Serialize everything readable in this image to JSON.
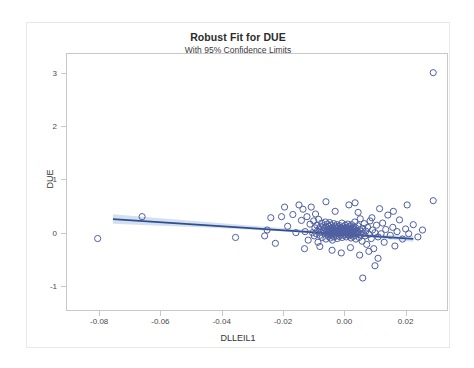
{
  "chart_data": {
    "type": "scatter",
    "title": "Robust Fit for DUE",
    "subtitle": "With 95% Confidence Limits",
    "xlabel": "DLLEIL1",
    "ylabel": "DUE",
    "xlim": [
      -0.0905,
      0.0335
    ],
    "ylim": [
      -1.45,
      3.35
    ],
    "xticks": [
      -0.08,
      -0.06,
      -0.04,
      -0.02,
      0.0,
      0.02
    ],
    "xtick_labels": [
      "-0.08",
      "-0.06",
      "-0.04",
      "-0.02",
      "0.00",
      "0.02"
    ],
    "yticks": [
      -1,
      0,
      1,
      2,
      3
    ],
    "ytick_labels": [
      "-1",
      "0",
      "1",
      "2",
      "3"
    ],
    "grid": false,
    "legend": "none",
    "marker": {
      "shape": "open-circle",
      "stroke": "#4f5fa0",
      "fill": "none",
      "radius": 3.1,
      "stroke_width": 1.0
    },
    "fit_line": {
      "name": "Robust fit",
      "color": "#2f4e8f",
      "width": 1.7,
      "x_start": -0.0755,
      "x_end": 0.0225,
      "y_start": 0.255,
      "y_end": -0.115
    },
    "confidence_band": {
      "name": "95% Confidence Limits",
      "level": 95,
      "fill": "#b9cbe6",
      "opacity": 0.62,
      "x": [
        -0.0755,
        -0.06,
        -0.045,
        -0.03,
        -0.015,
        0.0,
        0.01,
        0.0225
      ],
      "upper": [
        0.345,
        0.272,
        0.2,
        0.13,
        0.062,
        0.0,
        -0.03,
        -0.06
      ],
      "lower": [
        0.165,
        0.13,
        0.096,
        0.056,
        0.008,
        -0.052,
        -0.098,
        -0.17
      ]
    },
    "points": [
      [
        -0.0805,
        -0.11
      ],
      [
        -0.066,
        0.3
      ],
      [
        -0.0355,
        -0.09
      ],
      [
        -0.0252,
        0.05
      ],
      [
        -0.0225,
        -0.2
      ],
      [
        -0.0205,
        0.3
      ],
      [
        -0.0185,
        0.12
      ],
      [
        -0.0168,
        0.34
      ],
      [
        -0.0158,
        0.0
      ],
      [
        -0.0148,
        0.52
      ],
      [
        -0.014,
        0.23
      ],
      [
        -0.0135,
        0.44
      ],
      [
        -0.0128,
        0.02
      ],
      [
        -0.0122,
        0.3
      ],
      [
        -0.0118,
        -0.14
      ],
      [
        -0.0112,
        0.16
      ],
      [
        -0.0108,
        0.48
      ],
      [
        -0.0104,
        0.0
      ],
      [
        -0.01,
        0.22
      ],
      [
        -0.0098,
        -0.06
      ],
      [
        -0.0096,
        0.09
      ],
      [
        -0.0094,
        0.35
      ],
      [
        -0.0092,
        -0.02
      ],
      [
        -0.009,
        0.14
      ],
      [
        -0.0088,
        0.03
      ],
      [
        -0.0086,
        -0.18
      ],
      [
        -0.0084,
        0.25
      ],
      [
        -0.0082,
        0.07
      ],
      [
        -0.008,
        -0.05
      ],
      [
        -0.0078,
        0.11
      ],
      [
        -0.0076,
        0.01
      ],
      [
        -0.0074,
        0.18
      ],
      [
        -0.0072,
        -0.09
      ],
      [
        -0.007,
        0.05
      ],
      [
        -0.0068,
        0.13
      ],
      [
        -0.0066,
        -0.01
      ],
      [
        -0.0064,
        0.08
      ],
      [
        -0.0062,
        0.2
      ],
      [
        -0.006,
        -0.12
      ],
      [
        -0.0058,
        0.02
      ],
      [
        -0.0057,
        0.1
      ],
      [
        -0.0056,
        -0.04
      ],
      [
        -0.0055,
        0.16
      ],
      [
        -0.0054,
        0.0
      ],
      [
        -0.0053,
        0.06
      ],
      [
        -0.0052,
        -0.07
      ],
      [
        -0.0051,
        0.12
      ],
      [
        -0.005,
        0.02
      ],
      [
        -0.0049,
        -0.02
      ],
      [
        -0.0048,
        0.19
      ],
      [
        -0.0047,
        0.04
      ],
      [
        -0.0046,
        -0.1
      ],
      [
        -0.0045,
        0.08
      ],
      [
        -0.0044,
        0.0
      ],
      [
        -0.0043,
        0.14
      ],
      [
        -0.0042,
        -0.05
      ],
      [
        -0.0041,
        0.06
      ],
      [
        -0.004,
        0.01
      ],
      [
        -0.0039,
        -0.14
      ],
      [
        -0.0038,
        0.1
      ],
      [
        -0.0037,
        0.03
      ],
      [
        -0.0036,
        -0.01
      ],
      [
        -0.0035,
        0.17
      ],
      [
        -0.0034,
        -0.08
      ],
      [
        -0.0033,
        0.05
      ],
      [
        -0.0032,
        0.0
      ],
      [
        -0.0031,
        0.09
      ],
      [
        -0.003,
        -0.03
      ],
      [
        -0.0029,
        0.12
      ],
      [
        -0.0028,
        0.02
      ],
      [
        -0.0027,
        -0.06
      ],
      [
        -0.0026,
        0.07
      ],
      [
        -0.0025,
        0.0
      ],
      [
        -0.0024,
        0.15
      ],
      [
        -0.0023,
        -0.11
      ],
      [
        -0.0022,
        0.04
      ],
      [
        -0.0021,
        0.08
      ],
      [
        -0.002,
        -0.02
      ],
      [
        -0.0019,
        0.11
      ],
      [
        -0.0018,
        0.01
      ],
      [
        -0.0017,
        -0.07
      ],
      [
        -0.0016,
        0.06
      ],
      [
        -0.0015,
        0.0
      ],
      [
        -0.0014,
        0.13
      ],
      [
        -0.0013,
        -0.04
      ],
      [
        -0.0012,
        0.03
      ],
      [
        -0.0011,
        0.09
      ],
      [
        -0.001,
        -0.01
      ],
      [
        -0.0009,
        0.05
      ],
      [
        -0.0008,
        0.18
      ],
      [
        -0.0007,
        -0.09
      ],
      [
        -0.0006,
        0.02
      ],
      [
        -0.0005,
        0.07
      ],
      [
        -0.0004,
        0.0
      ],
      [
        -0.0003,
        0.11
      ],
      [
        -0.0002,
        -0.05
      ],
      [
        -0.0001,
        0.04
      ],
      [
        0.0,
        0.01
      ],
      [
        0.0001,
        0.08
      ],
      [
        0.0002,
        -0.03
      ],
      [
        0.0003,
        0.14
      ],
      [
        0.0004,
        0.0
      ],
      [
        0.0005,
        0.05
      ],
      [
        0.0006,
        -0.08
      ],
      [
        0.0007,
        0.1
      ],
      [
        0.0008,
        0.02
      ],
      [
        0.0009,
        -0.01
      ],
      [
        0.001,
        0.06
      ],
      [
        0.0011,
        0.16
      ],
      [
        0.0012,
        -0.04
      ],
      [
        0.0013,
        0.03
      ],
      [
        0.0014,
        0.09
      ],
      [
        0.0015,
        0.0
      ],
      [
        0.0016,
        -0.06
      ],
      [
        0.0017,
        0.12
      ],
      [
        0.0018,
        0.04
      ],
      [
        0.0019,
        -0.02
      ],
      [
        0.002,
        0.07
      ],
      [
        0.0021,
        0.01
      ],
      [
        0.0022,
        -0.1
      ],
      [
        0.0023,
        0.05
      ],
      [
        0.0024,
        0.15
      ],
      [
        0.0025,
        -0.03
      ],
      [
        0.0026,
        0.02
      ],
      [
        0.0027,
        0.08
      ],
      [
        0.0028,
        0.0
      ],
      [
        0.0029,
        -0.07
      ],
      [
        0.003,
        0.11
      ],
      [
        0.0031,
        0.03
      ],
      [
        0.0032,
        -0.01
      ],
      [
        0.0033,
        0.06
      ],
      [
        0.0034,
        0.2
      ],
      [
        0.0035,
        -0.05
      ],
      [
        0.0036,
        0.01
      ],
      [
        0.0037,
        0.09
      ],
      [
        0.0038,
        -0.12
      ],
      [
        0.004,
        0.04
      ],
      [
        0.0042,
        -0.02
      ],
      [
        0.0044,
        0.13
      ],
      [
        0.0046,
        0.0
      ],
      [
        0.0048,
        -0.09
      ],
      [
        0.005,
        0.06
      ],
      [
        0.0052,
        0.26
      ],
      [
        0.0054,
        -0.04
      ],
      [
        0.0056,
        0.02
      ],
      [
        0.0058,
        -0.16
      ],
      [
        0.006,
        0.08
      ],
      [
        0.0062,
        -0.01
      ],
      [
        0.0065,
        0.17
      ],
      [
        0.0068,
        -0.06
      ],
      [
        0.007,
        0.03
      ],
      [
        0.0073,
        -0.22
      ],
      [
        0.0076,
        0.1
      ],
      [
        0.008,
        -0.03
      ],
      [
        0.0084,
        0.22
      ],
      [
        0.0088,
        -0.11
      ],
      [
        0.0092,
        0.05
      ],
      [
        0.0096,
        -0.3
      ],
      [
        0.01,
        0.0
      ],
      [
        0.0105,
        0.14
      ],
      [
        0.011,
        -0.08
      ],
      [
        0.0115,
        0.45
      ],
      [
        0.012,
        -0.02
      ],
      [
        0.0125,
        0.18
      ],
      [
        0.013,
        -0.18
      ],
      [
        0.0135,
        0.06
      ],
      [
        0.0142,
        0.33
      ],
      [
        0.015,
        -0.05
      ],
      [
        0.0158,
        0.1
      ],
      [
        0.0165,
        -0.25
      ],
      [
        0.0172,
        0.02
      ],
      [
        0.018,
        0.24
      ],
      [
        0.019,
        -0.12
      ],
      [
        0.02,
        0.07
      ],
      [
        0.021,
        -0.02
      ],
      [
        0.0225,
        0.15
      ],
      [
        0.024,
        -0.08
      ],
      [
        0.0255,
        0.05
      ],
      [
        0.029,
        0.6
      ],
      [
        0.029,
        3.0
      ],
      [
        -0.013,
        -0.3
      ],
      [
        -0.008,
        -0.26
      ],
      [
        -0.004,
        -0.33
      ],
      [
        -0.001,
        -0.38
      ],
      [
        0.002,
        -0.28
      ],
      [
        0.005,
        -0.42
      ],
      [
        0.008,
        -0.35
      ],
      [
        0.011,
        -0.48
      ],
      [
        0.006,
        -0.85
      ],
      [
        0.01,
        -0.62
      ],
      [
        0.0035,
        0.56
      ],
      [
        0.0015,
        0.52
      ],
      [
        -0.006,
        0.58
      ],
      [
        -0.003,
        0.4
      ],
      [
        0.0045,
        0.38
      ],
      [
        0.009,
        0.28
      ],
      [
        0.016,
        0.4
      ],
      [
        0.0205,
        0.52
      ],
      [
        -0.024,
        0.28
      ],
      [
        -0.0195,
        0.48
      ],
      [
        -0.026,
        -0.06
      ]
    ]
  }
}
